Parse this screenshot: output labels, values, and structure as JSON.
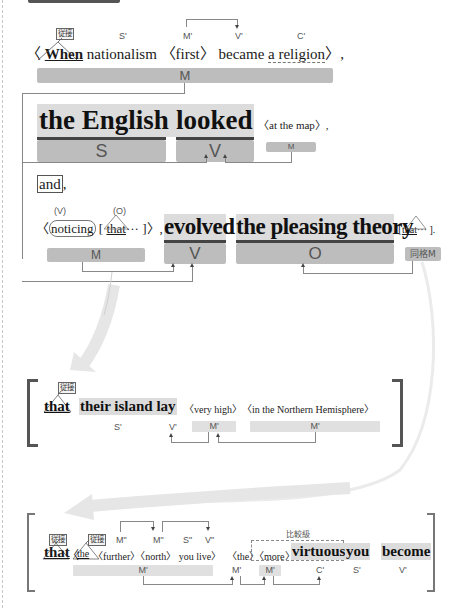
{
  "labels": {
    "subordinate_conj": "従接",
    "appositive_m": "同格M",
    "comparative": "比較級"
  },
  "sentence1": {
    "open": "〈",
    "when": "When",
    "rest": "nationalism 〈first〉 became",
    "complement": "a religion",
    "close": "〉,",
    "roles": {
      "s": "S'",
      "m": "M'",
      "v": "V'",
      "c": "C'",
      "bar": "M"
    }
  },
  "sentence2": {
    "subject": "the English",
    "verb": "looked",
    "modifier": "〈at the map〉,",
    "roles": {
      "s": "S",
      "v": "V",
      "m": "M"
    }
  },
  "conjunction": {
    "and": "and",
    "comma": ","
  },
  "sentence3": {
    "participle_open": "〈",
    "participle": "noticing",
    "that_open": "[",
    "that": "that",
    "that_rest": "··· ]〉,",
    "verb": "evolved",
    "object": "the pleasing theory",
    "app_open": "[",
    "app_that": "that",
    "app_rest": "··· ].",
    "roles": {
      "pv": "(V)",
      "po": "(O)",
      "m": "M",
      "v": "V",
      "o": "O"
    }
  },
  "clause1": {
    "that": "that",
    "body": "their island lay",
    "very_high": "〈very high〉",
    "location": "〈in the Northern Hemisphere〉",
    "roles": {
      "s": "S'",
      "v": "V'",
      "m1": "M'",
      "m2": "M'"
    }
  },
  "clause2": {
    "that": "that",
    "open": "〈",
    "the": "the",
    "further_north": "〈further〉〈north〉 you live〉",
    "the2": "〈the〉",
    "more": "〈more〉",
    "virtuous": "virtuous",
    "you": "you",
    "become": "become",
    "roles": {
      "m2a": "M\"",
      "m2b": "M\"",
      "s2": "S\"",
      "v2": "V\"",
      "m_bar": "M'",
      "m_the": "M'",
      "m_more": "M'",
      "c": "C'",
      "s": "S'",
      "v": "V'"
    }
  }
}
